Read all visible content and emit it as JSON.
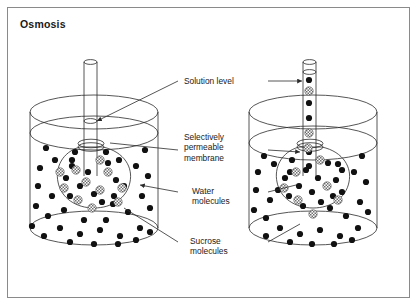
{
  "figure": {
    "title": "Osmosis",
    "border_color": "#8a8a8a",
    "background": "#ffffff",
    "ink_color": "#2b2b2b",
    "water_color": "#111111",
    "sucrose_color": "#7d7d7d",
    "width": 418,
    "height": 306
  },
  "labels": {
    "solution_level": "Solution level",
    "membrane_line1": "Selectively",
    "membrane_line2": "permeable",
    "membrane_line3": "membrane",
    "water_line1": "Water",
    "water_line2": "molecules",
    "sucrose_line1": "Sucrose",
    "sucrose_line2": "molecules"
  },
  "diagram_data": {
    "type": "scientific-illustration",
    "subject": "Osmosis across a selectively permeable membrane",
    "panels": [
      {
        "name": "left-beaker",
        "state": "initial",
        "tube_filled": false,
        "tube_solution_height": 0,
        "beaker_level": "high",
        "membrane_sac": "bulb with sucrose and water molecules",
        "sucrose_count": 11,
        "water_in_sac_count": 10,
        "water_in_beaker_count": 34
      },
      {
        "name": "right-beaker",
        "state": "after osmosis",
        "tube_filled": true,
        "tube_solution_height": "risen to near top of tube",
        "beaker_level": "low",
        "membrane_sac": "bulb with sucrose and water molecules",
        "sucrose_count": 8,
        "water_in_sac_count": 14,
        "water_in_beaker_count": 27
      }
    ],
    "legend": [
      {
        "symbol": "solid black dot",
        "meaning": "Water molecules"
      },
      {
        "symbol": "gray checkered dot",
        "meaning": "Sucrose molecules"
      }
    ],
    "callouts": [
      {
        "label": "Solution level",
        "targets": [
          "left tube meniscus",
          "right tube meniscus"
        ]
      },
      {
        "label": "Selectively permeable membrane",
        "targets": [
          "left sac neck",
          "right sac neck"
        ]
      },
      {
        "label": "Water molecules",
        "targets": [
          "left beaker water dot",
          "right beaker water dot"
        ]
      },
      {
        "label": "Sucrose molecules",
        "targets": [
          "left sac sucrose dot",
          "right sac sucrose dot"
        ]
      }
    ]
  }
}
